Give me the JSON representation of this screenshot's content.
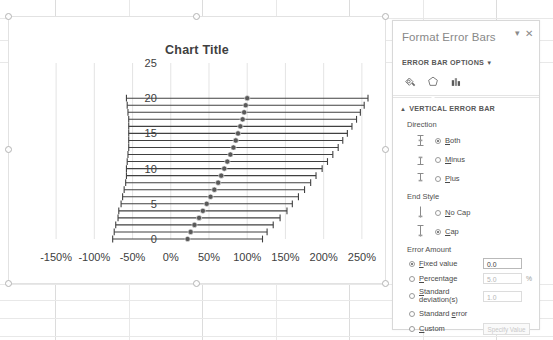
{
  "chart_data": {
    "type": "scatter",
    "title": "Chart Title",
    "xlabel": "",
    "ylabel": "",
    "xtick_labels": [
      "-150%",
      "-100%",
      "-50%",
      "0%",
      "50%",
      "100%",
      "150%",
      "200%",
      "250%"
    ],
    "xtick_values": [
      -150,
      -100,
      -50,
      0,
      50,
      100,
      150,
      200,
      250
    ],
    "ytick_labels": [
      "0",
      "5",
      "10",
      "15",
      "20",
      "25"
    ],
    "ytick_values": [
      0,
      5,
      10,
      15,
      20,
      25
    ],
    "xlim": [
      -175,
      275
    ],
    "ylim": [
      0,
      25
    ],
    "grid": true,
    "legend": "none",
    "error_bars": {
      "direction": "both",
      "end_style": "cap",
      "orientation": "horizontal"
    },
    "points": [
      {
        "y": 0,
        "x": 22,
        "err": 98
      },
      {
        "y": 1,
        "x": 26,
        "err": 100
      },
      {
        "y": 2,
        "x": 31,
        "err": 103
      },
      {
        "y": 3,
        "x": 37,
        "err": 106
      },
      {
        "y": 4,
        "x": 42,
        "err": 110
      },
      {
        "y": 5,
        "x": 47,
        "err": 112
      },
      {
        "y": 6,
        "x": 52,
        "err": 115
      },
      {
        "y": 7,
        "x": 57,
        "err": 118
      },
      {
        "y": 8,
        "x": 62,
        "err": 121
      },
      {
        "y": 9,
        "x": 66,
        "err": 124
      },
      {
        "y": 10,
        "x": 70,
        "err": 128
      },
      {
        "y": 11,
        "x": 74,
        "err": 131
      },
      {
        "y": 12,
        "x": 78,
        "err": 134
      },
      {
        "y": 13,
        "x": 82,
        "err": 137
      },
      {
        "y": 14,
        "x": 85,
        "err": 140
      },
      {
        "y": 15,
        "x": 88,
        "err": 143
      },
      {
        "y": 16,
        "x": 91,
        "err": 146
      },
      {
        "y": 17,
        "x": 94,
        "err": 149
      },
      {
        "y": 18,
        "x": 96,
        "err": 152
      },
      {
        "y": 19,
        "x": 98,
        "err": 155
      },
      {
        "y": 20,
        "x": 100,
        "err": 158
      }
    ],
    "colors": {
      "marker": "#595959",
      "error_bar": "#404040",
      "gridline": "#d9d9d9",
      "title": "#404040",
      "tick_label": "#404040"
    }
  },
  "chart_object": {
    "selected": true,
    "handles": [
      "top-left",
      "top-center",
      "top-right",
      "middle-left",
      "middle-right",
      "bottom-left",
      "bottom-center",
      "bottom-right"
    ]
  },
  "task_pane": {
    "title": "Format Error Bars",
    "menu_icon": "chevron-down-icon",
    "close_icon": "close-icon",
    "options_label": "ERROR BAR OPTIONS",
    "options_caret": "▼",
    "icons": [
      {
        "name": "fill-and-line-icon",
        "label": "Fill & Line",
        "selected": false
      },
      {
        "name": "effects-icon",
        "label": "Effects",
        "selected": false
      },
      {
        "name": "error-bar-options-icon",
        "label": "Error Bar Options",
        "selected": true
      }
    ],
    "section": {
      "caret": "▲",
      "label": "VERTICAL ERROR BAR",
      "direction": {
        "label": "Direction",
        "options": [
          {
            "label": "Both",
            "accel": "B",
            "selected": true,
            "icon": "error-bar-both-icon"
          },
          {
            "label": "Minus",
            "accel": "M",
            "selected": false,
            "icon": "error-bar-minus-icon"
          },
          {
            "label": "Plus",
            "accel": "P",
            "selected": false,
            "icon": "error-bar-plus-icon"
          }
        ]
      },
      "end_style": {
        "label": "End Style",
        "options": [
          {
            "label": "No Cap",
            "accel": "N",
            "selected": false,
            "icon": "error-bar-nocap-icon"
          },
          {
            "label": "Cap",
            "accel": "C",
            "selected": true,
            "icon": "error-bar-cap-icon"
          }
        ]
      },
      "error_amount": {
        "label": "Error Amount",
        "options": [
          {
            "label": "Fixed value",
            "accel": "F",
            "selected": true,
            "value": "0.0",
            "suffix": "",
            "disabled": false
          },
          {
            "label": "Percentage",
            "accel": "P",
            "selected": false,
            "value": "5.0",
            "suffix": "%",
            "disabled": true
          },
          {
            "label": "Standard deviation(s)",
            "accel": "S",
            "selected": false,
            "value": "1.0",
            "suffix": "",
            "disabled": true
          },
          {
            "label": "Standard error",
            "accel": "e",
            "selected": false,
            "value": null,
            "suffix": "",
            "disabled": true
          },
          {
            "label": "Custom",
            "accel": "C",
            "selected": false,
            "value": null,
            "suffix": "",
            "disabled": true
          }
        ],
        "specify_button": "Specify Value"
      }
    }
  }
}
